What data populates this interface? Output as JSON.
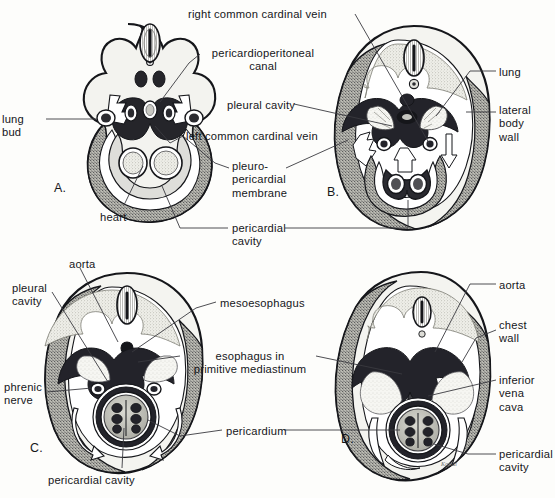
{
  "figure": {
    "background_color": "#fdfdfb",
    "ink_color": "#15161a",
    "signature": "Kottal"
  },
  "palette": {
    "outline": "#15161a",
    "mesenchyme_light": "#f2f2ee",
    "mesenchyme_mid": "#c9c9c2",
    "dark_tissue": "#2b2b2f",
    "stipple": "#8b8b84",
    "cavity_white": "#ffffff",
    "leader_line": "#3a3a3f"
  },
  "panels": [
    {
      "id": "A",
      "letter": "A.",
      "letter_pos": {
        "x": 54,
        "y": 181
      },
      "caption": "Early embryo: lung buds bulge into pericardioperitoneal canals"
    },
    {
      "id": "B",
      "letter": "B.",
      "letter_pos": {
        "x": 327,
        "y": 185
      },
      "caption": "Pleuropericardial membranes with common cardinal veins"
    },
    {
      "id": "C",
      "letter": "C.",
      "letter_pos": {
        "x": 30,
        "y": 441
      },
      "caption": "Pleural cavities expand; phrenic nerves on pericardium"
    },
    {
      "id": "D",
      "letter": "D.",
      "letter_pos": {
        "x": 341,
        "y": 432
      },
      "caption": "Definitive pleural and pericardial cavities; chest wall formed"
    }
  ],
  "labels": [
    {
      "id": "lung-bud",
      "text": "lung\nbud",
      "x": 2,
      "y": 113,
      "align": "left",
      "panel": "A"
    },
    {
      "id": "heart",
      "text": "heart",
      "x": 100,
      "y": 211,
      "align": "left",
      "panel": "A"
    },
    {
      "id": "right-common-cardinal-vein",
      "text": "right common cardinal vein",
      "x": 188,
      "y": 8,
      "align": "left",
      "panel": "B"
    },
    {
      "id": "pericardioperitoneal-canal",
      "text": "pericardioperitoneal\ncanal",
      "x": 204,
      "y": 47,
      "align": "left",
      "panel": "A"
    },
    {
      "id": "pleural-cavity-b",
      "text": "pleural cavity",
      "x": 227,
      "y": 99,
      "align": "left",
      "panel": "B"
    },
    {
      "id": "left-common-cardinal-vein",
      "text": "left common cardinal vein",
      "x": 186,
      "y": 130,
      "align": "left",
      "panel": "A"
    },
    {
      "id": "pleuropericardial-membrane",
      "text": "pleuro-\npericardial\nmembrane",
      "x": 232,
      "y": 160,
      "align": "left",
      "panel": "A"
    },
    {
      "id": "pericardial-cavity-ab",
      "text": "pericardial\ncavity",
      "x": 232,
      "y": 222,
      "align": "left",
      "panel": "B"
    },
    {
      "id": "lung",
      "text": "lung",
      "x": 499,
      "y": 66,
      "align": "left",
      "panel": "B"
    },
    {
      "id": "lateral-body-wall",
      "text": "lateral\nbody\nwall",
      "x": 499,
      "y": 104,
      "align": "left",
      "panel": "B"
    },
    {
      "id": "aorta-c",
      "text": "aorta",
      "x": 69,
      "y": 258,
      "align": "left",
      "panel": "C"
    },
    {
      "id": "pleural-cavity-c",
      "text": "pleural\ncavity",
      "x": 12,
      "y": 282,
      "align": "left",
      "panel": "C"
    },
    {
      "id": "phrenic-nerve",
      "text": "phrenic\nnerve",
      "x": 4,
      "y": 381,
      "align": "left",
      "panel": "C"
    },
    {
      "id": "pericardial-cavity-c",
      "text": "pericardial cavity",
      "x": 48,
      "y": 474,
      "align": "left",
      "panel": "C"
    },
    {
      "id": "mesoesophagus",
      "text": "mesoesophagus",
      "x": 220,
      "y": 297,
      "align": "left",
      "panel": "C"
    },
    {
      "id": "esophagus-in-primitive-mediastinum",
      "text": "esophagus in\nprimitive mediastinum",
      "x": 184,
      "y": 350,
      "align": "left",
      "panel": "C"
    },
    {
      "id": "pericardium",
      "text": "pericardium",
      "x": 226,
      "y": 425,
      "align": "left",
      "panel": "C"
    },
    {
      "id": "aorta-d",
      "text": "aorta",
      "x": 499,
      "y": 279,
      "align": "left",
      "panel": "D"
    },
    {
      "id": "chest-wall",
      "text": "chest\nwall",
      "x": 499,
      "y": 319,
      "align": "left",
      "panel": "D"
    },
    {
      "id": "inferior-vena-cava",
      "text": "inferior\nvena\ncava",
      "x": 499,
      "y": 374,
      "align": "left",
      "panel": "D"
    },
    {
      "id": "pericardial-cavity-d",
      "text": "pericardial\ncavity",
      "x": 499,
      "y": 448,
      "align": "left",
      "panel": "D"
    }
  ],
  "structures": {
    "A": [
      "neural tube",
      "notochord",
      "dorsal aorta",
      "lung bud",
      "pericardioperitoneal canal",
      "heart",
      "pericardial cavity"
    ],
    "B": [
      "neural tube",
      "lung",
      "pleural cavity",
      "pleuropericardial membrane",
      "common cardinal vein",
      "lateral body wall",
      "pericardial cavity"
    ],
    "C": [
      "aorta",
      "esophagus",
      "mesoesophagus",
      "pleural cavity",
      "phrenic nerve",
      "pericardium",
      "pericardial cavity",
      "heart"
    ],
    "D": [
      "aorta",
      "esophagus",
      "inferior vena cava",
      "chest wall",
      "pericardium",
      "pericardial cavity",
      "heart"
    ]
  }
}
